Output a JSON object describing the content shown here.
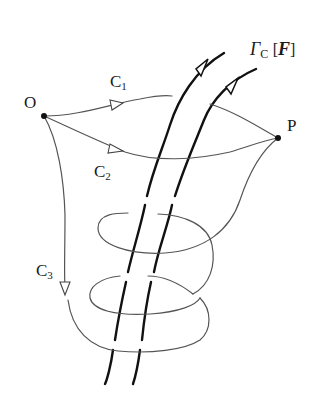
{
  "diagram": {
    "title_label": {
      "symbol": "Γ",
      "subscript": "C",
      "open_bracket": "[",
      "argument": "F",
      "close_bracket": "]"
    },
    "points": [
      {
        "id": "O",
        "label": "O"
      },
      {
        "id": "P",
        "label": "P"
      }
    ],
    "paths": [
      {
        "id": "C1",
        "base": "C",
        "index": "1",
        "from": "O",
        "to": "P",
        "route": "passes between field lines"
      },
      {
        "id": "C2",
        "base": "C",
        "index": "2",
        "from": "O",
        "to": "P",
        "route": "passes in front of field lines"
      },
      {
        "id": "C3",
        "base": "C",
        "index": "3",
        "from": "O",
        "to": "P",
        "route": "winds twice around field tube"
      }
    ],
    "field_tube": {
      "lines": 2,
      "direction": "upward-right",
      "arrowheads": "open triangle"
    },
    "colors": {
      "path_stroke": "#555555",
      "field_stroke": "#111111",
      "point_fill": "#111111"
    }
  }
}
